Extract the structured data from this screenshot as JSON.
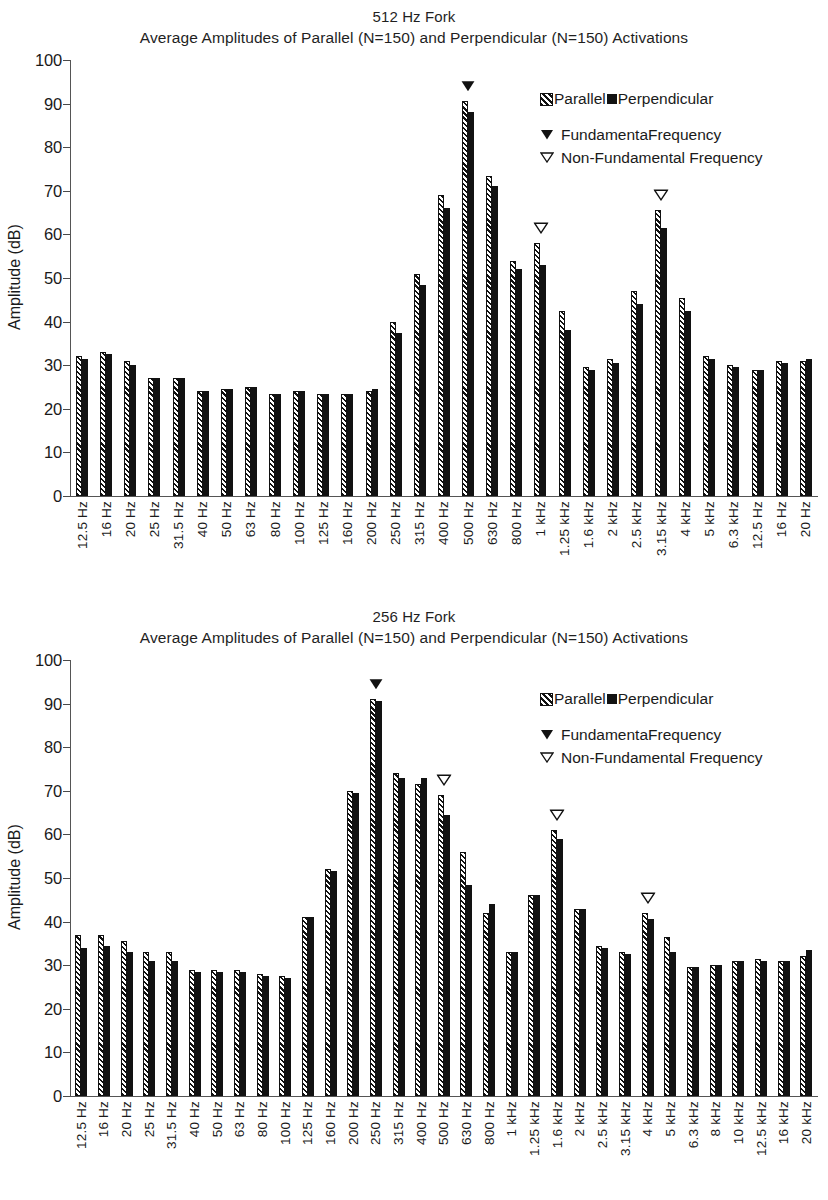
{
  "legend": {
    "parallel": "Parallel",
    "perpendicular": "Perpendicular",
    "fundamental": "FundamentaFrequency",
    "non_fundamental": "Non-Fundamental Frequency"
  },
  "axis": {
    "ylabel": "Amplitude (dB)",
    "yticks": [
      "0",
      "10",
      "20",
      "30",
      "40",
      "50",
      "60",
      "70",
      "80",
      "90",
      "100"
    ]
  },
  "charts": [
    {
      "title": "512 Hz Fork",
      "subtitle": "Average Amplitudes of Parallel (N=150) and Perpendicular (N=150) Activations"
    },
    {
      "title": "256 Hz Fork",
      "subtitle": "Average Amplitudes of Parallel (N=150) and Perpendicular (N=150) Activations"
    }
  ],
  "chart_data": [
    {
      "type": "bar",
      "title": "512 Hz Fork",
      "subtitle": "Average Amplitudes of Parallel (N=150) and Perpendicular (N=150) Activations",
      "xlabel": "",
      "ylabel": "Amplitude (dB)",
      "ylim": [
        0,
        100
      ],
      "ytick_step": 10,
      "grid": false,
      "legend_position": "top-right",
      "categories": [
        "12.5 Hz",
        "16 Hz",
        "20 Hz",
        "25 Hz",
        "31.5 Hz",
        "40 Hz",
        "50 Hz",
        "63 Hz",
        "80 Hz",
        "100 Hz",
        "125 Hz",
        "160 Hz",
        "200 Hz",
        "250 Hz",
        "315 Hz",
        "400 Hz",
        "500 Hz",
        "630 Hz",
        "800 Hz",
        "1 kHz",
        "1.25 kHz",
        "1.6 kHz",
        "2 kHz",
        "2.5 kHz",
        "3.15 kHz",
        "4 kHz",
        "5 kHz",
        "6.3 kHz",
        "12.5 Hz",
        "16 Hz",
        "20 Hz"
      ],
      "series": [
        {
          "name": "Parallel",
          "values": [
            32.0,
            33.0,
            31.0,
            27.0,
            27.0,
            24.0,
            24.5,
            25.0,
            23.5,
            24.0,
            23.5,
            23.5,
            24.0,
            40.0,
            51.0,
            69.0,
            90.5,
            73.5,
            54.0,
            58.0,
            42.5,
            29.5,
            31.5,
            47.0,
            65.5,
            45.5,
            32.0,
            30.0,
            29.0,
            31.0,
            31.0
          ]
        },
        {
          "name": "Perpendicular",
          "values": [
            31.5,
            32.5,
            30.0,
            27.0,
            27.0,
            24.0,
            24.5,
            25.0,
            23.5,
            24.0,
            23.5,
            23.5,
            24.5,
            37.5,
            48.5,
            66.0,
            88.0,
            71.0,
            52.0,
            53.0,
            38.0,
            29.0,
            30.5,
            44.0,
            61.5,
            42.5,
            31.5,
            29.5,
            29.0,
            30.5,
            31.5
          ]
        }
      ],
      "markers": [
        {
          "category": "500 Hz",
          "type": "fundamental",
          "label": "FundamentaFrequency"
        },
        {
          "category": "1 kHz",
          "type": "non-fundamental",
          "label": "Non-Fundamental Frequency"
        },
        {
          "category": "3.15 kHz",
          "type": "non-fundamental",
          "label": "Non-Fundamental Frequency"
        }
      ]
    },
    {
      "type": "bar",
      "title": "256 Hz Fork",
      "subtitle": "Average Amplitudes of Parallel (N=150) and Perpendicular (N=150) Activations",
      "xlabel": "",
      "ylabel": "Amplitude (dB)",
      "ylim": [
        0,
        100
      ],
      "ytick_step": 10,
      "grid": false,
      "legend_position": "top-right",
      "categories": [
        "12.5 Hz",
        "16 Hz",
        "20 Hz",
        "25 Hz",
        "31.5 Hz",
        "40 Hz",
        "50 Hz",
        "63 Hz",
        "80 Hz",
        "100 Hz",
        "125 Hz",
        "160 Hz",
        "200 Hz",
        "250 Hz",
        "315 Hz",
        "400 Hz",
        "500 Hz",
        "630 Hz",
        "800 Hz",
        "1 kHz",
        "1.25 kHz",
        "1.6 kHz",
        "2 kHz",
        "2.5 kHz",
        "3.15 kHz",
        "4 kHz",
        "5 kHz",
        "6.3 kHz",
        "8 kHz",
        "10 kHz",
        "12.5 kHz",
        "16 kHz",
        "20 kHz"
      ],
      "series": [
        {
          "name": "Parallel",
          "values": [
            37.0,
            37.0,
            35.5,
            33.0,
            33.0,
            29.0,
            29.0,
            29.0,
            28.0,
            27.5,
            41.0,
            52.0,
            70.0,
            91.0,
            74.0,
            71.5,
            69.0,
            56.0,
            42.0,
            33.0,
            46.0,
            61.0,
            43.0,
            34.5,
            33.0,
            42.0,
            36.5,
            29.5,
            30.0,
            31.0,
            31.5,
            31.0,
            32.0
          ]
        },
        {
          "name": "Perpendicular",
          "values": [
            34.0,
            34.5,
            33.0,
            31.0,
            31.0,
            28.5,
            28.5,
            28.5,
            27.5,
            27.0,
            41.0,
            51.5,
            69.5,
            90.5,
            73.0,
            73.0,
            64.5,
            48.5,
            44.0,
            33.0,
            46.0,
            59.0,
            43.0,
            34.0,
            32.5,
            40.5,
            33.0,
            29.5,
            30.0,
            31.0,
            31.0,
            31.0,
            33.5
          ]
        }
      ],
      "markers": [
        {
          "category": "250 Hz",
          "type": "fundamental",
          "label": "FundamentaFrequency"
        },
        {
          "category": "500 Hz",
          "type": "non-fundamental",
          "label": "Non-Fundamental Frequency"
        },
        {
          "category": "1.6 kHz",
          "type": "non-fundamental",
          "label": "Non-Fundamental Frequency"
        },
        {
          "category": "4 kHz",
          "type": "non-fundamental",
          "label": "Non-Fundamental Frequency"
        }
      ]
    }
  ]
}
